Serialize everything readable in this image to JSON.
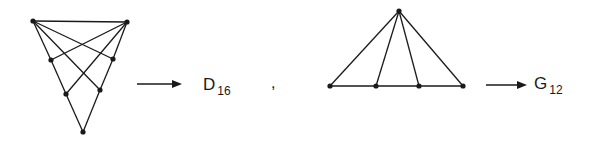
{
  "figure": {
    "stroke_color": "#1a1a1a",
    "left_graph": {
      "vertices": [
        {
          "id": "a",
          "x": 33,
          "y": 21
        },
        {
          "id": "b",
          "x": 127,
          "y": 22
        },
        {
          "id": "c",
          "x": 51,
          "y": 60
        },
        {
          "id": "d",
          "x": 113,
          "y": 59
        },
        {
          "id": "e",
          "x": 66,
          "y": 94
        },
        {
          "id": "f",
          "x": 100,
          "y": 90
        },
        {
          "id": "g",
          "x": 83,
          "y": 132
        }
      ],
      "edges": [
        [
          "a",
          "b"
        ],
        [
          "a",
          "c"
        ],
        [
          "a",
          "d"
        ],
        [
          "a",
          "f"
        ],
        [
          "b",
          "c"
        ],
        [
          "b",
          "d"
        ],
        [
          "b",
          "e"
        ],
        [
          "c",
          "e"
        ],
        [
          "d",
          "f"
        ],
        [
          "e",
          "g"
        ],
        [
          "f",
          "g"
        ]
      ],
      "label": {
        "main": "D",
        "sub": "16"
      }
    },
    "separator": ",",
    "right_graph": {
      "vertices": [
        {
          "id": "p",
          "x": 399,
          "y": 11
        },
        {
          "id": "q",
          "x": 330,
          "y": 86
        },
        {
          "id": "r",
          "x": 376,
          "y": 86
        },
        {
          "id": "s",
          "x": 419,
          "y": 86
        },
        {
          "id": "t",
          "x": 463,
          "y": 86
        }
      ],
      "edges": [
        [
          "p",
          "q"
        ],
        [
          "p",
          "r"
        ],
        [
          "p",
          "s"
        ],
        [
          "p",
          "t"
        ],
        [
          "q",
          "t"
        ]
      ],
      "label": {
        "main": "G",
        "sub": "12"
      }
    },
    "arrows": [
      {
        "x1": 137,
        "x2": 182,
        "y": 84
      },
      {
        "x1": 486,
        "x2": 527,
        "y": 85
      }
    ]
  }
}
